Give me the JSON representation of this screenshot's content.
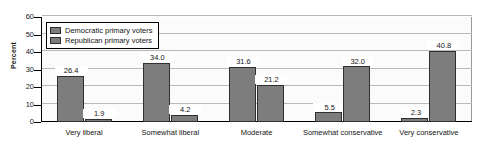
{
  "chart_data": {
    "type": "bar",
    "title": "",
    "xlabel": "",
    "ylabel": "Percent",
    "ylim": [
      0,
      60
    ],
    "yticks": [
      0,
      10,
      20,
      30,
      40,
      50,
      60
    ],
    "ytick_labels": [
      "0",
      "10",
      "20",
      "30",
      "40",
      "50",
      "60"
    ],
    "grid": true,
    "legend_position": "upper left",
    "categories": [
      "Very liberal",
      "Somewhat liberal",
      "Moderate",
      "Somewhat conservative",
      "Very conservative"
    ],
    "series": [
      {
        "name": "Democratic primary voters",
        "color": "#7d7d7d",
        "values": [
          26.4,
          34.0,
          31.6,
          5.5,
          2.3
        ],
        "labels": [
          "26.4",
          "34.0",
          "31.6",
          "5.5",
          "2.3"
        ]
      },
      {
        "name": "Republican primary voters",
        "color": "#7d7d7d",
        "values": [
          1.9,
          4.2,
          21.2,
          32.0,
          40.8
        ],
        "labels": [
          "1.9",
          "4.2",
          "21.2",
          "32.0",
          "40.8"
        ]
      }
    ]
  },
  "legend": {
    "items": [
      {
        "label": "Democratic primary voters"
      },
      {
        "label": "Republican primary voters"
      }
    ]
  },
  "axis": {
    "y_title": "Percent"
  }
}
